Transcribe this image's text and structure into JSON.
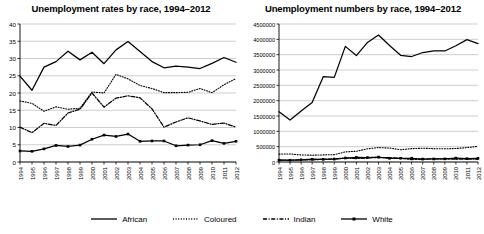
{
  "figure": {
    "background": "#ffffff",
    "series_color": "#000000"
  },
  "legend": {
    "position": "bottom-center",
    "items": [
      {
        "label": "African",
        "style": "solid",
        "marker": "none",
        "color": "#000000"
      },
      {
        "label": "Coloured",
        "style": "dotted",
        "marker": "none",
        "color": "#000000"
      },
      {
        "label": "Indian",
        "style": "dash-dot",
        "marker": "none",
        "color": "#000000"
      },
      {
        "label": "White",
        "style": "solid",
        "marker": "square",
        "color": "#000000"
      }
    ]
  },
  "chart_data": [
    {
      "id": "rates",
      "type": "line",
      "title": "Unemployment rates by race, 1994–2012",
      "xlabel": "",
      "ylabel": "",
      "ylim": [
        0,
        40
      ],
      "yticks": [
        0,
        5,
        10,
        15,
        20,
        25,
        30,
        35,
        40
      ],
      "ytick_labels": [
        "0",
        "5",
        "10",
        "15",
        "20",
        "25",
        "30",
        "35",
        "40"
      ],
      "grid": "horizontal",
      "legend_position": "below-figure",
      "x": [
        1994,
        1995,
        1996,
        1997,
        1998,
        1999,
        2000,
        2001,
        2002,
        2003,
        2004,
        2005,
        2006,
        2007,
        2008,
        2009,
        2010,
        2011,
        2012
      ],
      "xtick_labels": [
        "1994",
        "1995",
        "1996",
        "1997",
        "1998",
        "1999",
        "2000",
        "2001",
        "2002",
        "2003",
        "2004",
        "2005",
        "2006",
        "2007",
        "2008",
        "2009",
        "2010",
        "2011",
        "2012"
      ],
      "series": [
        {
          "name": "African",
          "style": "solid",
          "marker": "none",
          "values": [
            24.9,
            20.8,
            27.5,
            29.1,
            32.1,
            29.6,
            31.8,
            28.5,
            32.5,
            34.9,
            32.0,
            29.1,
            27.3,
            27.8,
            27.5,
            27.1,
            28.6,
            30.3,
            28.9
          ]
        },
        {
          "name": "Coloured",
          "style": "dotted",
          "marker": "none",
          "values": [
            17.7,
            17.0,
            14.7,
            16.0,
            15.3,
            15.6,
            20.3,
            20.0,
            25.4,
            24.1,
            22.2,
            21.3,
            20.1,
            20.1,
            20.2,
            21.3,
            20.1,
            22.4,
            24.2
          ]
        },
        {
          "name": "Indian",
          "style": "dash-dot",
          "marker": "none",
          "values": [
            10.1,
            8.5,
            11.2,
            10.6,
            14.2,
            15.3,
            20.0,
            15.9,
            18.5,
            19.2,
            18.6,
            15.4,
            10.1,
            11.6,
            12.8,
            11.9,
            10.9,
            11.3,
            10.1
          ]
        },
        {
          "name": "White",
          "style": "solid",
          "marker": "square",
          "values": [
            3.2,
            3.1,
            3.8,
            4.8,
            4.5,
            4.9,
            6.6,
            7.8,
            7.4,
            8.1,
            6.0,
            6.1,
            6.1,
            4.7,
            4.9,
            5.0,
            6.2,
            5.4,
            6.0
          ]
        }
      ]
    },
    {
      "id": "numbers",
      "type": "line",
      "title": "Unemployment numbers by race, 1994–2012",
      "xlabel": "",
      "ylabel": "",
      "ylim": [
        0,
        4500000
      ],
      "yticks": [
        0,
        500000,
        1000000,
        1500000,
        2000000,
        2500000,
        3000000,
        3500000,
        4000000,
        4500000
      ],
      "ytick_labels": [
        "0",
        "500000",
        "1000000",
        "1500000",
        "2000000",
        "2500000",
        "3000000",
        "3500000",
        "4000000",
        "4500000"
      ],
      "grid": "horizontal",
      "legend_position": "below-figure",
      "x": [
        1994,
        1995,
        1996,
        1997,
        1998,
        1999,
        2000,
        2001,
        2002,
        2003,
        2004,
        2005,
        2006,
        2007,
        2008,
        2009,
        2010,
        2011,
        2012
      ],
      "xtick_labels": [
        "1994",
        "1995",
        "1996",
        "1997",
        "1998",
        "1999",
        "2000",
        "2001",
        "2002",
        "2003",
        "2004",
        "2005",
        "2006",
        "2007",
        "2008",
        "2009",
        "2010",
        "2011",
        "2012"
      ],
      "series": [
        {
          "name": "African",
          "style": "solid",
          "marker": "none",
          "values": [
            1640000,
            1370000,
            1660000,
            1940000,
            2780000,
            2760000,
            3770000,
            3470000,
            3900000,
            4140000,
            3800000,
            3480000,
            3440000,
            3570000,
            3620000,
            3620000,
            3790000,
            3990000,
            3860000
          ]
        },
        {
          "name": "Coloured",
          "style": "dotted",
          "marker": "none",
          "values": [
            258000,
            262000,
            230000,
            222000,
            232000,
            240000,
            330000,
            350000,
            430000,
            470000,
            455000,
            400000,
            435000,
            450000,
            435000,
            430000,
            440000,
            470000,
            510000
          ]
        },
        {
          "name": "Indian",
          "style": "dash-dot",
          "marker": "none",
          "values": [
            62000,
            55000,
            70000,
            68000,
            92000,
            100000,
            130000,
            110000,
            135000,
            145000,
            140000,
            120000,
            80000,
            92000,
            105000,
            98000,
            92000,
            98000,
            88000
          ]
        },
        {
          "name": "White",
          "style": "solid",
          "marker": "square",
          "values": [
            60000,
            58000,
            72000,
            90000,
            86000,
            95000,
            130000,
            150000,
            145000,
            160000,
            120000,
            122000,
            122000,
            95000,
            99000,
            102000,
            126000,
            110000,
            122000
          ]
        }
      ]
    }
  ]
}
